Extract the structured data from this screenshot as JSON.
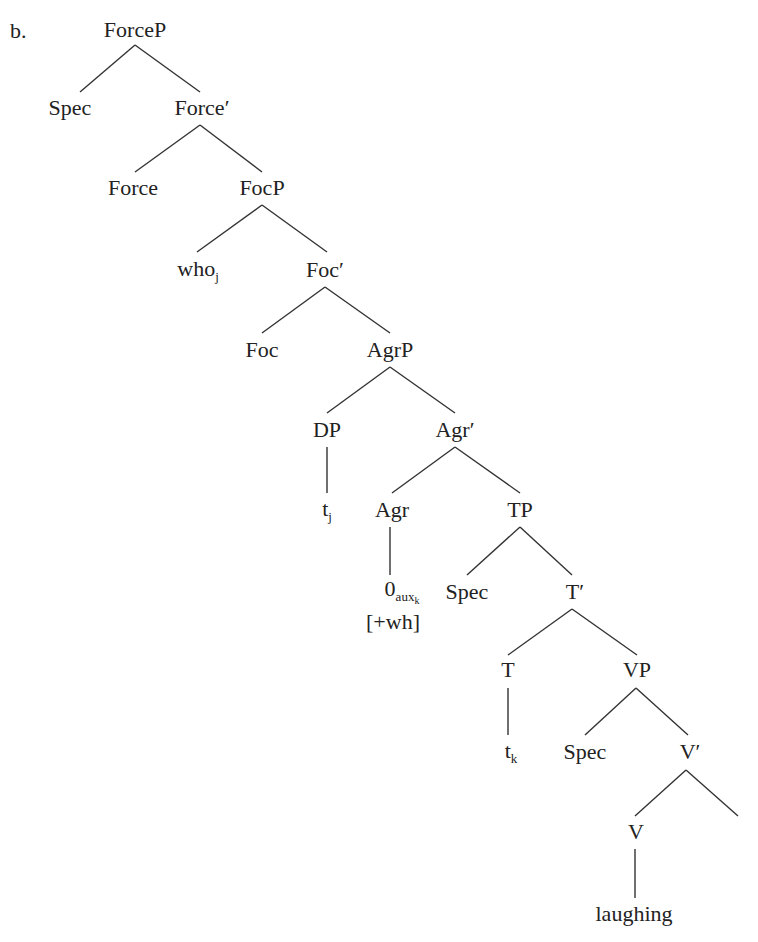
{
  "example_label": "b.",
  "nodes": {
    "forcep": {
      "label": "ForceP",
      "x": 135,
      "y": 30
    },
    "spec1": {
      "label": "Spec",
      "x": 70,
      "y": 108
    },
    "forcebar": {
      "label": "Force′",
      "x": 202,
      "y": 108
    },
    "force": {
      "label": "Force",
      "x": 133,
      "y": 188
    },
    "focp": {
      "label": "FocP",
      "x": 262,
      "y": 188
    },
    "who": {
      "label": "who",
      "sub": "j",
      "x": 198,
      "y": 270
    },
    "focbar": {
      "label": "Foc′",
      "x": 325,
      "y": 270
    },
    "foc": {
      "label": "Foc",
      "x": 262,
      "y": 350
    },
    "agrp": {
      "label": "AgrP",
      "x": 390,
      "y": 350
    },
    "dp": {
      "label": "DP",
      "x": 327,
      "y": 430
    },
    "agrbar": {
      "label": "Agr′",
      "x": 455,
      "y": 430
    },
    "tj": {
      "label": "t",
      "sub": "j",
      "x": 327,
      "y": 510
    },
    "agr": {
      "label": "Agr",
      "x": 392,
      "y": 510
    },
    "tp": {
      "label": "TP",
      "x": 520,
      "y": 510
    },
    "zero": {
      "label": "0",
      "sub": "aux",
      "subsub": "k",
      "x": 402,
      "y": 592
    },
    "wh": {
      "label": "[+wh]",
      "x": 393,
      "y": 622
    },
    "spec2": {
      "label": "Spec",
      "x": 467,
      "y": 592
    },
    "tbar": {
      "label": "T′",
      "x": 575,
      "y": 592
    },
    "t": {
      "label": "T",
      "x": 508,
      "y": 670
    },
    "vp": {
      "label": "VP",
      "x": 637,
      "y": 670
    },
    "tk": {
      "label": "t",
      "sub": "k",
      "x": 511,
      "y": 752
    },
    "spec3": {
      "label": "Spec",
      "x": 585,
      "y": 752
    },
    "vbar": {
      "label": "V′",
      "x": 690,
      "y": 752
    },
    "v": {
      "label": "V",
      "x": 636,
      "y": 832
    },
    "laughing": {
      "label": "laughing",
      "x": 634,
      "y": 914
    }
  },
  "edges": [
    [
      135,
      45,
      80,
      92
    ],
    [
      135,
      45,
      200,
      92
    ],
    [
      200,
      125,
      135,
      172
    ],
    [
      200,
      125,
      262,
      172
    ],
    [
      262,
      205,
      197,
      252
    ],
    [
      262,
      205,
      327,
      252
    ],
    [
      325,
      287,
      262,
      333
    ],
    [
      325,
      287,
      390,
      333
    ],
    [
      390,
      367,
      327,
      413
    ],
    [
      390,
      367,
      455,
      413
    ],
    [
      327,
      447,
      327,
      493
    ],
    [
      455,
      447,
      392,
      493
    ],
    [
      455,
      447,
      520,
      493
    ],
    [
      390,
      527,
      390,
      575
    ],
    [
      520,
      527,
      467,
      575
    ],
    [
      520,
      527,
      572,
      575
    ],
    [
      572,
      609,
      508,
      655
    ],
    [
      572,
      609,
      637,
      655
    ],
    [
      508,
      688,
      508,
      735
    ],
    [
      636,
      688,
      585,
      735
    ],
    [
      636,
      688,
      688,
      735
    ],
    [
      686,
      770,
      635,
      816
    ],
    [
      686,
      770,
      738,
      816
    ],
    [
      635,
      849,
      635,
      898
    ]
  ],
  "colors": {
    "line": "#333333",
    "text": "#222222"
  }
}
